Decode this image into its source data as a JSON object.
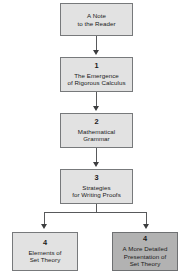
{
  "diagram": {
    "colors": {
      "box_fill": "#e2e2e2",
      "box_fill_highlight": "#b2b2b2",
      "box_border": "#77797b",
      "connector": "#58595b",
      "background": "#ffffff",
      "text": "#1a1a1a"
    },
    "nodes": [
      {
        "id": "note",
        "number": "",
        "title": "A Note\nto the Reader",
        "highlight": false
      },
      {
        "id": "chapter-1",
        "number": "1",
        "title": "The Emergence\nof Rigorous Calculus",
        "highlight": false
      },
      {
        "id": "chapter-2",
        "number": "2",
        "title": "Mathematical\nGrammar",
        "highlight": false
      },
      {
        "id": "chapter-3",
        "number": "3",
        "title": "Strategies\nfor Writing Proofs",
        "highlight": false
      },
      {
        "id": "chapter-4a",
        "number": "4",
        "title": "Elements of\nSet Theory",
        "highlight": false
      },
      {
        "id": "chapter-4b",
        "number": "4",
        "title": "A More Detailed\nPresentation of\nSet Theory",
        "highlight": true
      }
    ],
    "edges": [
      {
        "from": "note",
        "to": "chapter-1",
        "style": "arrow-down"
      },
      {
        "from": "chapter-1",
        "to": "chapter-2",
        "style": "arrow-down"
      },
      {
        "from": "chapter-2",
        "to": "chapter-3",
        "style": "arrow-down"
      },
      {
        "from": "chapter-3",
        "to": "chapter-4a",
        "style": "branch-left"
      },
      {
        "from": "chapter-3",
        "to": "chapter-4b",
        "style": "branch-right"
      }
    ]
  }
}
